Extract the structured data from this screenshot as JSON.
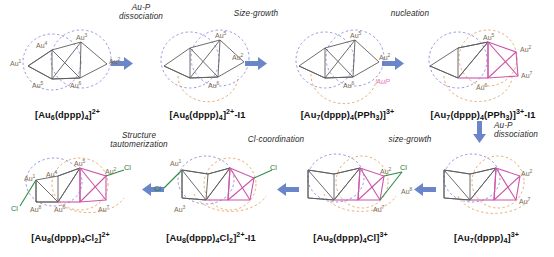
{
  "figure": {
    "type": "reaction-scheme",
    "title": "",
    "rows": 2,
    "colors": {
      "arrow_blue": "#6b86c8",
      "bond_gray": "#5c5c5c",
      "bond_pink": "#cc55a8",
      "bond_green": "#2e8b45",
      "dashed_blue": "#6b6bd6",
      "dashed_orange": "#e08a3c",
      "label_gold": "#7a6a52",
      "label_pink": "#e57ab5",
      "background": "#ffffff"
    }
  },
  "steps": [
    {
      "id": "step-au-p-dissociation-1",
      "label": "Au-P\ndissociation",
      "direction": "right"
    },
    {
      "id": "step-size-growth-1",
      "label": "Size-growth",
      "direction": "right"
    },
    {
      "id": "step-nucleation",
      "label": "nucleation",
      "direction": "right"
    },
    {
      "id": "step-au-p-dissociation-2",
      "label": "Au-P\ndissociation",
      "direction": "down"
    },
    {
      "id": "step-size-growth-2",
      "label": "size-growth",
      "direction": "left"
    },
    {
      "id": "step-cl-coordination",
      "label": "Cl-coordination",
      "direction": "left"
    },
    {
      "id": "step-structure-tautomerization",
      "label": "Structure\ntautomerization",
      "direction": "left"
    }
  ],
  "structures": [
    {
      "id": "struct-au6-dppp4",
      "row": "top",
      "position": 1,
      "formula_html": "[Au<sub>6</sub>(dppp)<sub>4</sub>]<sup>2+</sup>",
      "formula_text": "[Au6(dppp)4]2+",
      "atom_labels": [
        "Au1",
        "Au2",
        "Au3",
        "Au4",
        "Au5",
        "Au6"
      ],
      "dashed_circles": [
        "blue",
        "blue"
      ],
      "has_pink_bonds": false,
      "has_green_cl": false
    },
    {
      "id": "struct-au6-dppp4-i1",
      "row": "top",
      "position": 2,
      "formula_html": "[Au<sub>6</sub>(dppp)<sub>4</sub>]<sup>2+</sup>-I1",
      "formula_text": "[Au6(dppp)4]2+-I1",
      "atom_labels": [
        "Au2",
        "Au5",
        "Au6"
      ],
      "dashed_circles": [
        "blue",
        "blue",
        "orange"
      ],
      "has_pink_bonds": false,
      "has_green_cl": false
    },
    {
      "id": "struct-au7-dppp4-pph3",
      "row": "top",
      "position": 3,
      "formula_html": "[Au<sub>7</sub>(dppp)<sub>4</sub>(PPh<sub>3</sub>)]<sup>3+</sup>",
      "formula_text": "[Au7(dppp)4(PPh3)]3+",
      "atom_labels": [
        "Au2",
        "Au5",
        "Au6"
      ],
      "extra_labels": [
        "AuP"
      ],
      "dashed_circles": [
        "blue",
        "blue",
        "orange"
      ],
      "has_pink_bonds": false,
      "has_green_cl": false
    },
    {
      "id": "struct-au7-dppp4-pph3-i1",
      "row": "top",
      "position": 4,
      "formula_html": "[Au<sub>7</sub>(dppp)<sub>4</sub>(PPh<sub>3</sub>)]<sup>3+</sup>-I1",
      "formula_text": "[Au7(dppp)4(PPh3)]3+-I1",
      "atom_labels": [
        "Au2",
        "Au5",
        "Au6",
        "Au7"
      ],
      "dashed_circles": [
        "blue",
        "orange",
        "orange"
      ],
      "has_pink_bonds": true,
      "has_green_cl": false
    },
    {
      "id": "struct-au8-dppp4-cl2",
      "row": "bottom",
      "position": 1,
      "formula_html": "[Au<sub>8</sub>(dppp)<sub>4</sub>Cl<sub>2</sub>]<sup>2+</sup>",
      "formula_text": "[Au8(dppp)4Cl2]2+",
      "atom_labels": [
        "Au1",
        "Au2",
        "Au4",
        "Au5",
        "Au6",
        "Au7",
        "Au8"
      ],
      "extra_labels": [
        "Cl",
        "Cl"
      ],
      "dashed_circles": [
        "blue",
        "orange",
        "orange"
      ],
      "has_pink_bonds": true,
      "has_green_cl": true
    },
    {
      "id": "struct-au8-dppp4-cl2-i1",
      "row": "bottom",
      "position": 2,
      "formula_html": "[Au<sub>8</sub>(dppp)<sub>4</sub>Cl<sub>2</sub>]<sup>2+</sup>-I1",
      "formula_text": "[Au8(dppp)4Cl2]2+-I1",
      "atom_labels": [
        "Au1",
        "Au3"
      ],
      "extra_labels": [
        "Cl",
        "Cl"
      ],
      "dashed_circles": [
        "blue",
        "orange",
        "orange"
      ],
      "has_pink_bonds": true,
      "has_green_cl": true
    },
    {
      "id": "struct-au8-dppp4-cl",
      "row": "bottom",
      "position": 3,
      "formula_html": "[Au<sub>8</sub>(dppp)<sub>4</sub>Cl]<sup>3+</sup>",
      "formula_text": "[Au8(dppp)4Cl]3+",
      "atom_labels": [
        "Au2",
        "Au7",
        "Au8"
      ],
      "extra_labels": [
        "Cl"
      ],
      "dashed_circles": [
        "blue",
        "orange",
        "orange"
      ],
      "has_pink_bonds": true,
      "has_green_cl": true
    },
    {
      "id": "struct-au7-dppp4",
      "row": "bottom",
      "position": 4,
      "formula_html": "[Au<sub>7</sub>(dppp)<sub>4</sub>]<sup>3+</sup>",
      "formula_text": "[Au7(dppp)4]3+",
      "atom_labels": [
        "Au2",
        "Au7"
      ],
      "dashed_circles": [
        "blue",
        "orange",
        "orange"
      ],
      "has_pink_bonds": true,
      "has_green_cl": false
    }
  ]
}
